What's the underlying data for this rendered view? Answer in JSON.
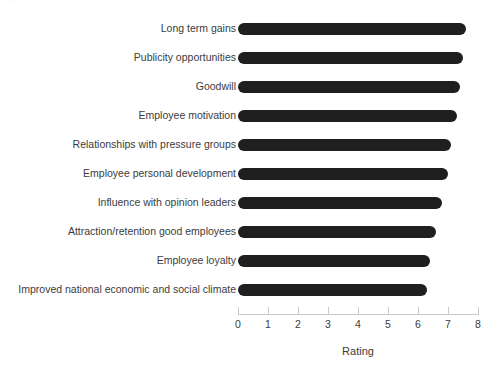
{
  "clipped_header": "...",
  "chart_data": {
    "type": "bar",
    "orientation": "horizontal",
    "title": "",
    "xlabel": "Rating",
    "ylabel": "",
    "xlim": [
      0,
      8
    ],
    "xticks": [
      0,
      1,
      2,
      3,
      4,
      5,
      6,
      7,
      8
    ],
    "xtick_labels": [
      "0",
      "1",
      "2",
      "3",
      "4",
      "5",
      "6",
      "7",
      "8"
    ],
    "grid": false,
    "legend": null,
    "bar_color": "#201f1f",
    "axis_color": "#c9c9cc",
    "categories": [
      "Long term gains",
      "Publicity opportunities",
      "Goodwill",
      "Employee motivation",
      "Relationships with pressure groups",
      "Employee personal development",
      "Influence with opinion leaders",
      "Attraction/retention good employees",
      "Employee loyalty",
      "Improved national economic and social climate"
    ],
    "values": [
      7.6,
      7.5,
      7.4,
      7.3,
      7.1,
      7.0,
      6.8,
      6.6,
      6.4,
      6.3
    ]
  }
}
